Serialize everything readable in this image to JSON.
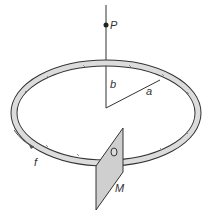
{
  "diagram": {
    "labels": {
      "point": "P",
      "height": "b",
      "radius": "a",
      "current": "f",
      "surface": "M"
    },
    "colors": {
      "stroke": "#333333",
      "ring_fill": "#d9d9d9",
      "plane_fill": "#cfcfcf"
    }
  }
}
